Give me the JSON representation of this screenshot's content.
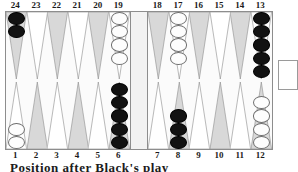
{
  "board": {
    "title": "Backgammon board position diagram",
    "colors": {
      "black_checker": "#121212",
      "white_checker": "#fdfdfd",
      "point_light": "#d8d8d8",
      "point_white": "#ffffff",
      "board_background": "#fbfbfb",
      "bar_background": "#f2f2f2",
      "border": "#8d8d8d",
      "label_text": "#1b1b1b"
    },
    "top_labels": [
      "24",
      "23",
      "22",
      "21",
      "20",
      "19",
      "18",
      "17",
      "16",
      "15",
      "14",
      "13"
    ],
    "bottom_labels": [
      "1",
      "2",
      "3",
      "4",
      "5",
      "6",
      "7",
      "8",
      "9",
      "10",
      "11",
      "12"
    ],
    "quadrants": {
      "top_left": [
        {
          "point": "24",
          "checkers": 2,
          "color": "black",
          "shade": "light"
        },
        {
          "point": "23",
          "checkers": 0,
          "color": "none",
          "shade": "white"
        },
        {
          "point": "22",
          "checkers": 0,
          "color": "none",
          "shade": "light"
        },
        {
          "point": "21",
          "checkers": 0,
          "color": "none",
          "shade": "white"
        },
        {
          "point": "20",
          "checkers": 0,
          "color": "none",
          "shade": "light"
        },
        {
          "point": "19",
          "checkers": 4,
          "color": "white",
          "shade": "white"
        }
      ],
      "top_right": [
        {
          "point": "18",
          "checkers": 0,
          "color": "none",
          "shade": "light"
        },
        {
          "point": "17",
          "checkers": 4,
          "color": "white",
          "shade": "white"
        },
        {
          "point": "16",
          "checkers": 0,
          "color": "none",
          "shade": "light"
        },
        {
          "point": "15",
          "checkers": 0,
          "color": "none",
          "shade": "white"
        },
        {
          "point": "14",
          "checkers": 0,
          "color": "none",
          "shade": "light"
        },
        {
          "point": "13",
          "checkers": 5,
          "color": "black",
          "shade": "white"
        }
      ],
      "bottom_left": [
        {
          "point": "1",
          "checkers": 2,
          "color": "white",
          "shade": "white"
        },
        {
          "point": "2",
          "checkers": 0,
          "color": "none",
          "shade": "light"
        },
        {
          "point": "3",
          "checkers": 0,
          "color": "none",
          "shade": "white"
        },
        {
          "point": "4",
          "checkers": 0,
          "color": "none",
          "shade": "light"
        },
        {
          "point": "5",
          "checkers": 0,
          "color": "none",
          "shade": "white"
        },
        {
          "point": "6",
          "checkers": 5,
          "color": "black",
          "shade": "light"
        }
      ],
      "bottom_right": [
        {
          "point": "7",
          "checkers": 0,
          "color": "none",
          "shade": "white"
        },
        {
          "point": "8",
          "checkers": 3,
          "color": "black",
          "shade": "light"
        },
        {
          "point": "9",
          "checkers": 0,
          "color": "none",
          "shade": "white"
        },
        {
          "point": "10",
          "checkers": 0,
          "color": "none",
          "shade": "light"
        },
        {
          "point": "11",
          "checkers": 0,
          "color": "none",
          "shade": "white"
        },
        {
          "point": "12",
          "checkers": 4,
          "color": "white",
          "shade": "light"
        }
      ]
    },
    "bar": {
      "black_on_bar": 0,
      "white_on_bar": 0
    },
    "bear_off_tray": {
      "checkers": 0,
      "label": ""
    },
    "caption": "Position after Black's play"
  }
}
